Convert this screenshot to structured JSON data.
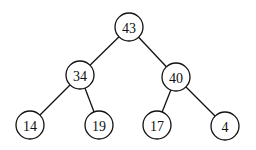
{
  "diagram": {
    "type": "binary-tree",
    "nodes": [
      {
        "id": "n43",
        "label": "43",
        "x": 129,
        "y": 27
      },
      {
        "id": "n34",
        "label": "34",
        "x": 80,
        "y": 75
      },
      {
        "id": "n40",
        "label": "40",
        "x": 176,
        "y": 77
      },
      {
        "id": "n14",
        "label": "14",
        "x": 30,
        "y": 125
      },
      {
        "id": "n19",
        "label": "19",
        "x": 99,
        "y": 125
      },
      {
        "id": "n17",
        "label": "17",
        "x": 157,
        "y": 125
      },
      {
        "id": "n4",
        "label": "4",
        "x": 225,
        "y": 126
      }
    ],
    "edges": [
      {
        "from": "n43",
        "to": "n34"
      },
      {
        "from": "n43",
        "to": "n40"
      },
      {
        "from": "n34",
        "to": "n14"
      },
      {
        "from": "n34",
        "to": "n19"
      },
      {
        "from": "n40",
        "to": "n17"
      },
      {
        "from": "n40",
        "to": "n4"
      }
    ],
    "radius": 14
  }
}
